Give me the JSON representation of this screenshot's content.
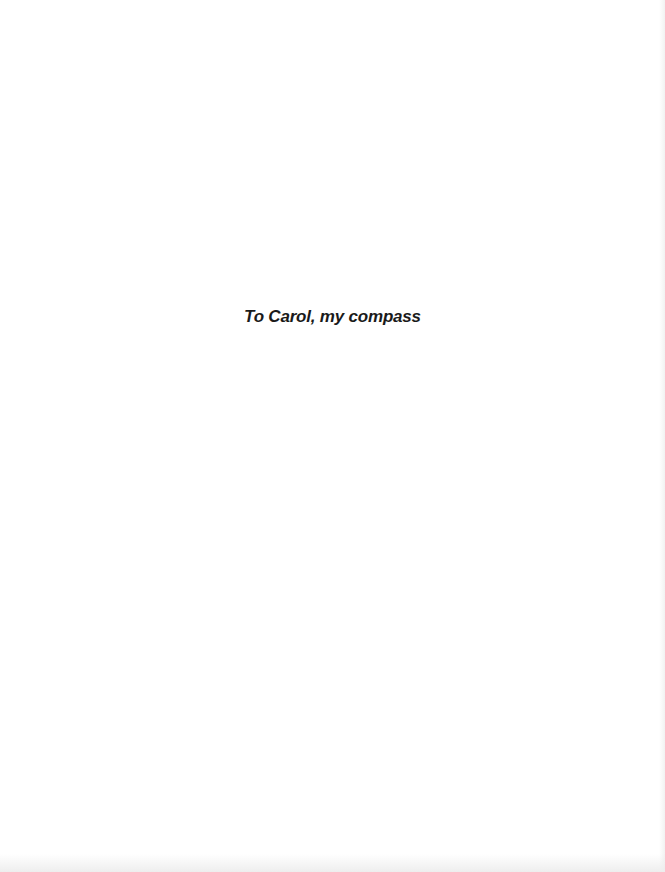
{
  "page": {
    "background_color": "#ffffff",
    "dedication": {
      "text": "To Carol, my compass",
      "color": "#1a1a1a"
    }
  }
}
